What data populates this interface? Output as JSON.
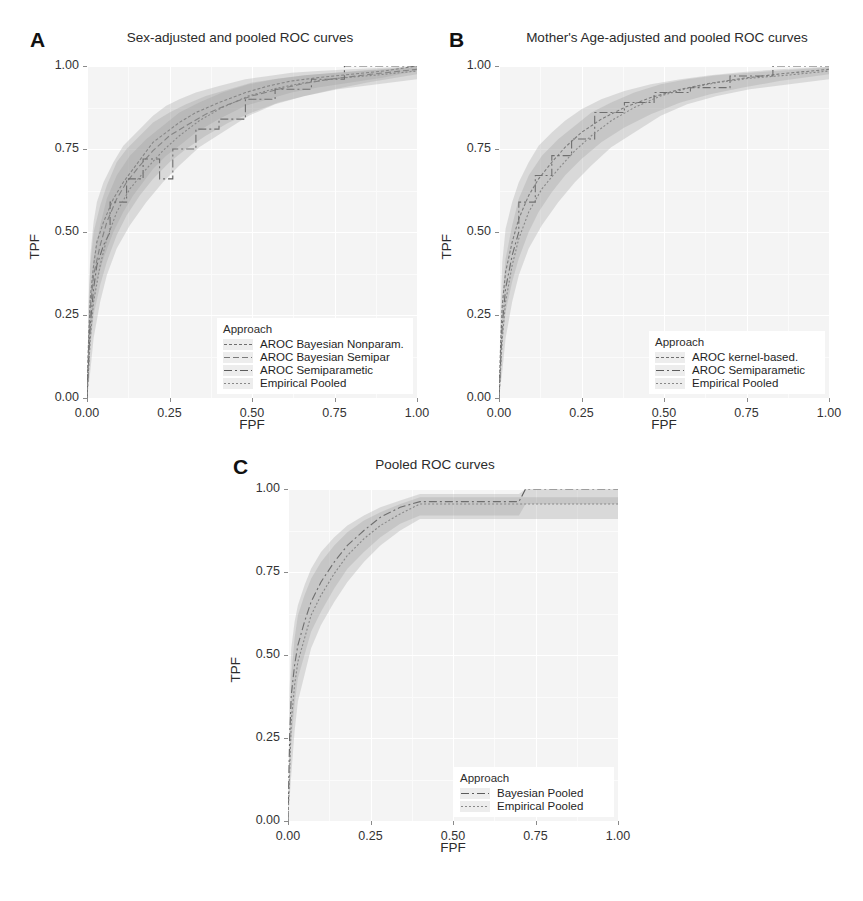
{
  "figure": {
    "background": "#ffffff",
    "panel_background": "#f4f4f4",
    "axis_text_color": "#333333"
  },
  "panels": [
    {
      "letter": "A",
      "title": "Sex-adjusted and pooled ROC curves",
      "legend_title": "Approach",
      "legend_items": [
        {
          "label": "AROC Bayesian Nonparam.",
          "dash": "3,2",
          "color": "#6f6f6f"
        },
        {
          "label": "AROC Bayesian Semipar",
          "dash": "6,3",
          "color": "#7a7a7a"
        },
        {
          "label": "AROC Semiparametic",
          "dash": "8,3,2,3",
          "color": "#5c5c5c"
        },
        {
          "label": "Empirical Pooled",
          "dash": "2,2",
          "color": "#888888"
        }
      ]
    },
    {
      "letter": "B",
      "title": "Mother's Age-adjusted and pooled ROC curves",
      "legend_title": "Approach",
      "legend_items": [
        {
          "label": "AROC kernel-based.",
          "dash": "3,2",
          "color": "#6f6f6f"
        },
        {
          "label": "AROC Semiparametic",
          "dash": "8,3,2,3",
          "color": "#5c5c5c"
        },
        {
          "label": "Empirical Pooled",
          "dash": "2,2",
          "color": "#888888"
        }
      ]
    },
    {
      "letter": "C",
      "title": "Pooled ROC curves",
      "legend_title": "Approach",
      "legend_items": [
        {
          "label": "Bayesian Pooled",
          "dash": "8,3,2,3",
          "color": "#5c5c5c"
        },
        {
          "label": "Empirical Pooled",
          "dash": "2,2",
          "color": "#888888"
        }
      ]
    }
  ],
  "chart_data": [
    {
      "panel": "A",
      "type": "line",
      "title": "Sex-adjusted and pooled ROC curves",
      "xlabel": "FPF",
      "ylabel": "TPF",
      "xlim": [
        0,
        1
      ],
      "ylim": [
        0,
        1
      ],
      "xticks": [
        "0.00",
        "0.25",
        "0.50",
        "0.75",
        "1.00"
      ],
      "yticks": [
        "0.00",
        "0.25",
        "0.50",
        "0.75",
        "1.00"
      ],
      "grid": true,
      "legend_position": "bottom-right",
      "series": [
        {
          "name": "AROC Bayesian Nonparam.",
          "x": [
            0.0,
            0.005,
            0.01,
            0.02,
            0.03,
            0.05,
            0.08,
            0.11,
            0.14,
            0.17,
            0.2,
            0.24,
            0.28,
            0.33,
            0.4,
            0.48,
            0.55,
            0.62,
            0.7,
            0.8,
            0.9,
            1.0
          ],
          "y": [
            0.0,
            0.18,
            0.3,
            0.4,
            0.47,
            0.53,
            0.6,
            0.65,
            0.69,
            0.73,
            0.77,
            0.8,
            0.83,
            0.86,
            0.89,
            0.92,
            0.94,
            0.955,
            0.965,
            0.975,
            0.985,
            1.0
          ],
          "band_lower": [
            0.0,
            0.08,
            0.18,
            0.28,
            0.35,
            0.42,
            0.5,
            0.56,
            0.61,
            0.65,
            0.69,
            0.73,
            0.76,
            0.8,
            0.84,
            0.88,
            0.9,
            0.92,
            0.935,
            0.95,
            0.965,
            0.985
          ],
          "band_upper": [
            0.0,
            0.3,
            0.43,
            0.53,
            0.59,
            0.65,
            0.71,
            0.76,
            0.79,
            0.82,
            0.85,
            0.88,
            0.9,
            0.92,
            0.94,
            0.96,
            0.97,
            0.98,
            0.985,
            0.99,
            0.995,
            1.0
          ]
        },
        {
          "name": "AROC Bayesian Semipar",
          "x": [
            0.0,
            0.005,
            0.01,
            0.02,
            0.04,
            0.06,
            0.09,
            0.12,
            0.16,
            0.2,
            0.25,
            0.3,
            0.36,
            0.43,
            0.5,
            0.58,
            0.66,
            0.75,
            0.85,
            1.0
          ],
          "y": [
            0.0,
            0.15,
            0.27,
            0.37,
            0.46,
            0.53,
            0.6,
            0.65,
            0.7,
            0.745,
            0.79,
            0.82,
            0.855,
            0.885,
            0.91,
            0.93,
            0.948,
            0.962,
            0.974,
            0.99
          ],
          "band_lower": [
            0.0,
            0.06,
            0.15,
            0.25,
            0.34,
            0.41,
            0.49,
            0.55,
            0.61,
            0.66,
            0.71,
            0.75,
            0.79,
            0.83,
            0.86,
            0.89,
            0.91,
            0.93,
            0.95,
            0.975
          ],
          "band_upper": [
            0.0,
            0.27,
            0.4,
            0.5,
            0.58,
            0.64,
            0.71,
            0.75,
            0.79,
            0.83,
            0.86,
            0.885,
            0.91,
            0.93,
            0.95,
            0.962,
            0.972,
            0.98,
            0.988,
            0.998
          ]
        },
        {
          "name": "AROC Semiparametic",
          "x": [
            0.0,
            0.01,
            0.02,
            0.03,
            0.05,
            0.07,
            0.07,
            0.12,
            0.12,
            0.17,
            0.17,
            0.22,
            0.22,
            0.26,
            0.26,
            0.33,
            0.33,
            0.4,
            0.4,
            0.48,
            0.48,
            0.57,
            0.57,
            0.68,
            0.68,
            0.78,
            0.78,
            1.0
          ],
          "y": [
            0.0,
            0.22,
            0.33,
            0.4,
            0.46,
            0.5,
            0.59,
            0.59,
            0.66,
            0.66,
            0.72,
            0.72,
            0.66,
            0.66,
            0.75,
            0.75,
            0.81,
            0.81,
            0.84,
            0.84,
            0.9,
            0.9,
            0.93,
            0.93,
            0.96,
            0.96,
            1.0,
            1.0
          ],
          "step": true
        },
        {
          "name": "Empirical Pooled",
          "x": [
            0.0,
            0.01,
            0.02,
            0.04,
            0.06,
            0.09,
            0.13,
            0.18,
            0.23,
            0.28,
            0.34,
            0.41,
            0.49,
            0.57,
            0.66,
            0.76,
            0.88,
            1.0
          ],
          "y": [
            0.0,
            0.18,
            0.29,
            0.4,
            0.48,
            0.56,
            0.63,
            0.69,
            0.745,
            0.79,
            0.835,
            0.875,
            0.91,
            0.932,
            0.95,
            0.963,
            0.973,
            0.985
          ],
          "band_lower": [
            0.0,
            0.08,
            0.18,
            0.29,
            0.37,
            0.45,
            0.52,
            0.59,
            0.65,
            0.7,
            0.755,
            0.8,
            0.85,
            0.885,
            0.91,
            0.93,
            0.945,
            0.96
          ],
          "band_upper": [
            0.0,
            0.3,
            0.42,
            0.52,
            0.6,
            0.67,
            0.73,
            0.78,
            0.82,
            0.86,
            0.89,
            0.92,
            0.945,
            0.96,
            0.972,
            0.98,
            0.988,
            0.996
          ]
        }
      ]
    },
    {
      "panel": "B",
      "type": "line",
      "title": "Mother's Age-adjusted and pooled ROC curves",
      "xlabel": "FPF",
      "ylabel": "TPF",
      "xlim": [
        0,
        1
      ],
      "ylim": [
        0,
        1
      ],
      "xticks": [
        "0.00",
        "0.25",
        "0.50",
        "0.75",
        "1.00"
      ],
      "yticks": [
        "0.00",
        "0.25",
        "0.50",
        "0.75",
        "1.00"
      ],
      "grid": true,
      "legend_position": "bottom-right",
      "series": [
        {
          "name": "AROC kernel-based.",
          "x": [
            0.0,
            0.005,
            0.01,
            0.02,
            0.04,
            0.06,
            0.09,
            0.12,
            0.16,
            0.2,
            0.25,
            0.31,
            0.38,
            0.46,
            0.55,
            0.64,
            0.74,
            0.85,
            1.0
          ],
          "y": [
            0.0,
            0.16,
            0.28,
            0.38,
            0.47,
            0.54,
            0.61,
            0.66,
            0.71,
            0.755,
            0.8,
            0.84,
            0.875,
            0.905,
            0.93,
            0.948,
            0.963,
            0.976,
            0.99
          ],
          "band_lower": [
            0.0,
            0.07,
            0.16,
            0.26,
            0.35,
            0.42,
            0.5,
            0.56,
            0.62,
            0.67,
            0.72,
            0.77,
            0.815,
            0.855,
            0.89,
            0.915,
            0.935,
            0.955,
            0.975
          ],
          "band_upper": [
            0.0,
            0.28,
            0.41,
            0.51,
            0.59,
            0.65,
            0.71,
            0.76,
            0.8,
            0.835,
            0.87,
            0.9,
            0.925,
            0.945,
            0.96,
            0.972,
            0.982,
            0.99,
            0.998
          ]
        },
        {
          "name": "AROC Semiparametic",
          "x": [
            0.0,
            0.01,
            0.02,
            0.04,
            0.06,
            0.06,
            0.11,
            0.11,
            0.16,
            0.16,
            0.22,
            0.22,
            0.29,
            0.29,
            0.38,
            0.38,
            0.47,
            0.47,
            0.58,
            0.58,
            0.7,
            0.7,
            0.83,
            0.83,
            1.0
          ],
          "y": [
            0.0,
            0.22,
            0.33,
            0.43,
            0.5,
            0.59,
            0.59,
            0.67,
            0.67,
            0.73,
            0.73,
            0.78,
            0.78,
            0.86,
            0.86,
            0.89,
            0.89,
            0.92,
            0.92,
            0.935,
            0.935,
            0.97,
            0.97,
            1.0,
            1.0
          ],
          "step": true
        },
        {
          "name": "Empirical Pooled",
          "x": [
            0.0,
            0.01,
            0.02,
            0.04,
            0.06,
            0.09,
            0.13,
            0.18,
            0.23,
            0.28,
            0.34,
            0.41,
            0.49,
            0.57,
            0.66,
            0.76,
            0.88,
            1.0
          ],
          "y": [
            0.0,
            0.18,
            0.29,
            0.4,
            0.48,
            0.56,
            0.63,
            0.69,
            0.745,
            0.79,
            0.835,
            0.875,
            0.91,
            0.932,
            0.95,
            0.963,
            0.973,
            0.985
          ],
          "band_lower": [
            0.0,
            0.08,
            0.18,
            0.29,
            0.37,
            0.45,
            0.52,
            0.59,
            0.65,
            0.7,
            0.755,
            0.8,
            0.85,
            0.885,
            0.91,
            0.93,
            0.945,
            0.96
          ],
          "band_upper": [
            0.0,
            0.3,
            0.42,
            0.52,
            0.6,
            0.67,
            0.73,
            0.78,
            0.82,
            0.86,
            0.89,
            0.92,
            0.945,
            0.96,
            0.972,
            0.98,
            0.988,
            0.996
          ]
        }
      ]
    },
    {
      "panel": "C",
      "type": "line",
      "title": "Pooled ROC curves",
      "xlabel": "FPF",
      "ylabel": "TPF",
      "xlim": [
        0,
        1
      ],
      "ylim": [
        0,
        1
      ],
      "xticks": [
        "0.00",
        "0.25",
        "0.50",
        "0.75",
        "1.00"
      ],
      "yticks": [
        "0.00",
        "0.25",
        "0.50",
        "0.75",
        "1.00"
      ],
      "grid": true,
      "legend_position": "bottom-right",
      "series": [
        {
          "name": "Bayesian Pooled",
          "x": [
            0.0,
            0.005,
            0.01,
            0.02,
            0.03,
            0.05,
            0.07,
            0.1,
            0.14,
            0.18,
            0.23,
            0.28,
            0.34,
            0.4,
            0.5,
            0.6,
            0.7,
            0.72,
            1.0
          ],
          "y": [
            0.0,
            0.25,
            0.38,
            0.47,
            0.53,
            0.6,
            0.66,
            0.72,
            0.78,
            0.83,
            0.875,
            0.915,
            0.945,
            0.962,
            0.962,
            0.962,
            0.962,
            1.0,
            1.0
          ],
          "band_lower": [
            0.0,
            0.1,
            0.24,
            0.35,
            0.43,
            0.5,
            0.57,
            0.63,
            0.7,
            0.76,
            0.81,
            0.855,
            0.895,
            0.92,
            0.92,
            0.92,
            0.92,
            0.955,
            0.955
          ],
          "band_upper": [
            0.0,
            0.4,
            0.52,
            0.6,
            0.65,
            0.71,
            0.76,
            0.81,
            0.855,
            0.89,
            0.92,
            0.945,
            0.965,
            0.985,
            0.985,
            0.985,
            0.985,
            1.0,
            1.0
          ]
        },
        {
          "name": "Empirical Pooled",
          "x": [
            0.0,
            0.01,
            0.02,
            0.03,
            0.05,
            0.07,
            0.1,
            0.14,
            0.18,
            0.23,
            0.28,
            0.34,
            0.4,
            0.5,
            0.6,
            0.7,
            0.72,
            1.0
          ],
          "y": [
            0.0,
            0.3,
            0.41,
            0.48,
            0.55,
            0.62,
            0.68,
            0.745,
            0.8,
            0.85,
            0.89,
            0.925,
            0.955,
            0.955,
            0.955,
            0.955,
            0.955,
            0.955
          ],
          "band_lower": [
            0.0,
            0.14,
            0.27,
            0.36,
            0.44,
            0.52,
            0.59,
            0.66,
            0.72,
            0.78,
            0.83,
            0.875,
            0.91,
            0.91,
            0.91,
            0.91,
            0.91,
            0.91
          ],
          "band_upper": [
            0.0,
            0.44,
            0.55,
            0.62,
            0.68,
            0.73,
            0.78,
            0.83,
            0.87,
            0.905,
            0.93,
            0.955,
            0.975,
            0.975,
            0.975,
            0.975,
            0.975,
            0.975
          ]
        }
      ]
    }
  ]
}
